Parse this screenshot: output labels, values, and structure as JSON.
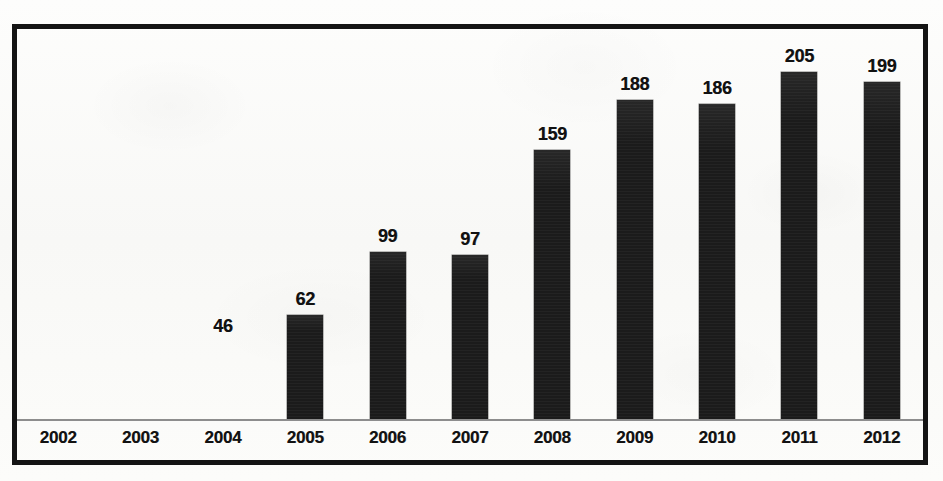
{
  "chart_data": {
    "type": "bar",
    "title": "",
    "subtitle": "",
    "xlabel": "",
    "ylabel": "",
    "grid": false,
    "legend": null,
    "axis_baseline_visible": true,
    "value_labels_shown": true,
    "ylim": [
      0,
      230
    ],
    "categories": [
      "2002",
      "2003",
      "2004",
      "2005",
      "2006",
      "2007",
      "2008",
      "2009",
      "2010",
      "2011",
      "2012"
    ],
    "values": [
      null,
      null,
      46,
      62,
      99,
      97,
      159,
      188,
      186,
      205,
      199
    ],
    "value_labels": [
      "",
      "",
      "46",
      "62",
      "99",
      "97",
      "159",
      "188",
      "186",
      "205",
      "199"
    ],
    "bars_rendered": [
      false,
      false,
      false,
      true,
      true,
      true,
      true,
      true,
      true,
      true,
      true
    ],
    "bar_color": "#1b1b1b",
    "frame_color": "#141414",
    "axis_color": "#8d8d8d",
    "background_color": "#fbfbf9"
  },
  "chart": {
    "points": [
      {
        "category": "2002",
        "label": "",
        "value": null,
        "has_bar": false
      },
      {
        "category": "2003",
        "label": "",
        "value": null,
        "has_bar": false
      },
      {
        "category": "2004",
        "label": "46",
        "value": 46,
        "has_bar": false
      },
      {
        "category": "2005",
        "label": "62",
        "value": 62,
        "has_bar": true
      },
      {
        "category": "2006",
        "label": "99",
        "value": 99,
        "has_bar": true
      },
      {
        "category": "2007",
        "label": "97",
        "value": 97,
        "has_bar": true
      },
      {
        "category": "2008",
        "label": "159",
        "value": 159,
        "has_bar": true
      },
      {
        "category": "2009",
        "label": "188",
        "value": 188,
        "has_bar": true
      },
      {
        "category": "2010",
        "label": "186",
        "value": 186,
        "has_bar": true
      },
      {
        "category": "2011",
        "label": "205",
        "value": 205,
        "has_bar": true
      },
      {
        "category": "2012",
        "label": "199",
        "value": 199,
        "has_bar": true
      }
    ]
  }
}
